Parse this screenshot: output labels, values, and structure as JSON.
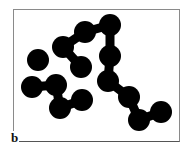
{
  "figure": {
    "panel_label": "b",
    "colors": {
      "particle": "#000000",
      "frame": "#8a8a8a",
      "background": "#ffffff"
    },
    "particle_radius": 11,
    "particles": [
      {
        "x": 38,
        "y": 60
      },
      {
        "x": 63,
        "y": 47
      },
      {
        "x": 85,
        "y": 32
      },
      {
        "x": 110,
        "y": 25
      },
      {
        "x": 81,
        "y": 67
      },
      {
        "x": 110,
        "y": 56
      },
      {
        "x": 108,
        "y": 81
      },
      {
        "x": 32,
        "y": 87
      },
      {
        "x": 56,
        "y": 85
      },
      {
        "x": 60,
        "y": 108
      },
      {
        "x": 82,
        "y": 100
      },
      {
        "x": 129,
        "y": 97
      },
      {
        "x": 139,
        "y": 120
      },
      {
        "x": 161,
        "y": 112
      }
    ],
    "bonds": [
      [
        1,
        2
      ],
      [
        2,
        3
      ],
      [
        1,
        4
      ],
      [
        3,
        5
      ],
      [
        5,
        6
      ],
      [
        7,
        8
      ],
      [
        8,
        9
      ],
      [
        9,
        10
      ],
      [
        6,
        11
      ],
      [
        11,
        12
      ],
      [
        12,
        13
      ]
    ]
  }
}
